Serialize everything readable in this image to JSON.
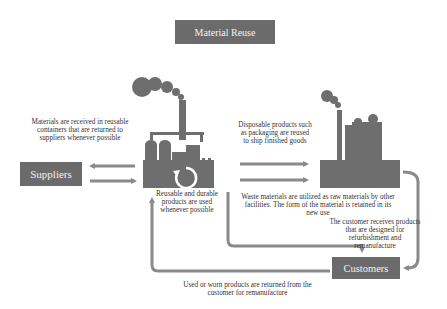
{
  "title": "Material Reuse",
  "nodes": {
    "suppliers": "Suppliers",
    "customers": "Customers"
  },
  "annotations": {
    "containers": "Materials are received in reusable containers that are returned to suppliers whenever possible",
    "durable": "Reusable and durable products are used whenever possible",
    "disposable": "Disposable products such as packaging are reused to ship finished goods",
    "waste": "Waste materials are utilized as raw materials by other facilities. The form of the material is retained in its new use",
    "customer_receives": "The customer receives products that are designed for refurbishment and remanufacture",
    "returned": "Used or worn products are returned from the customer for remanufacture"
  },
  "icons": {
    "main_factory": "factory-icon",
    "recycle": "recycle-icon",
    "other_facility": "factory-icon"
  },
  "colors": {
    "box": "#6b6b6b",
    "arrow": "#8a8a8a",
    "factory": "#6e6e6e"
  }
}
